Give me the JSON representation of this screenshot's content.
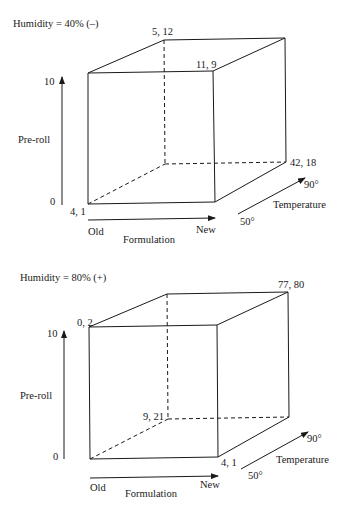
{
  "diagrams": [
    {
      "title": "Humidity = 40% (–)",
      "y_axis": {
        "label": "Pre-roll",
        "ticks": [
          "0",
          "10"
        ]
      },
      "x_axis": {
        "label": "Formulation",
        "low": "Old",
        "high": "New"
      },
      "z_axis": {
        "label": "Temperature",
        "low": "50°",
        "high": "90°"
      },
      "vertex_labels": {
        "front_bottom_left": "4, 1",
        "back_top_left": "5, 12",
        "front_top_right": "11, 9",
        "back_bottom_right": "42, 18"
      }
    },
    {
      "title": "Humidity = 80% (+)",
      "y_axis": {
        "label": "Pre-roll",
        "ticks": [
          "0",
          "10"
        ]
      },
      "x_axis": {
        "label": "Formulation",
        "low": "Old",
        "high": "New"
      },
      "z_axis": {
        "label": "Temperature",
        "low": "50°",
        "high": "90°"
      },
      "vertex_labels": {
        "front_top_left": "0, 2",
        "back_top_right": "77, 80",
        "back_bottom_left": "9, 21",
        "front_bottom_right": "4, 1"
      }
    }
  ]
}
